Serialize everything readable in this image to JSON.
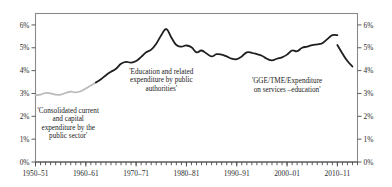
{
  "chart_data": {
    "type": "line",
    "title": "",
    "subtitle": "",
    "xlabel": "",
    "ylabel": "",
    "grid": false,
    "legend_position": "none",
    "xlim": [
      1950,
      2014
    ],
    "ylim": [
      0,
      6.5
    ],
    "y_axis_left": {
      "tick_labels": [
        "0%",
        "1%",
        "2%",
        "3%",
        "4%",
        "5%",
        "6%"
      ],
      "tick_values": [
        0,
        1,
        2,
        3,
        4,
        5,
        6
      ]
    },
    "y_axis_right": {
      "tick_labels": [
        "0%",
        "1%",
        "2%",
        "3%",
        "4%",
        "5%",
        "6%"
      ],
      "tick_values": [
        0,
        1,
        2,
        3,
        4,
        5,
        6
      ]
    },
    "x_axis": {
      "tick_labels": [
        "1950–51",
        "1960–61",
        "1970–71",
        "1980–81",
        "1990–91",
        "2000–01",
        "2010–11"
      ],
      "tick_values": [
        1950,
        1960,
        1970,
        1980,
        1990,
        2000,
        2010
      ],
      "minor_tick_interval": 1
    },
    "annotations": [
      {
        "name": "consolidated-expenditure-label",
        "lines": [
          "'Consolidated current",
          "and capital",
          "expenditure by the",
          "public sector'"
        ],
        "x": 1956.5,
        "y": 2.15
      },
      {
        "name": "education-related-expenditure-label",
        "lines": [
          "'Education and related",
          "expenditure by public",
          "authorities'"
        ],
        "x": 1975.0,
        "y": 3.85
      },
      {
        "name": "gge-tme-expenditure-label",
        "lines": [
          "'GGE/TME/Expenditure",
          "on services –education'"
        ],
        "x": 2000.0,
        "y": 3.45
      }
    ],
    "series": [
      {
        "name": "Consolidated current and capital expenditure by the public sector",
        "color": "#b9b9b9",
        "x": [
          1950,
          1951,
          1952,
          1953,
          1954,
          1955,
          1956,
          1957,
          1958,
          1959,
          1960,
          1961,
          1962
        ],
        "values": [
          2.92,
          2.95,
          3.02,
          3.0,
          2.95,
          2.95,
          3.02,
          3.08,
          3.05,
          3.1,
          3.22,
          3.35,
          3.48
        ]
      },
      {
        "name": "Education and related expenditure by public authorities",
        "color": "#1f1f1f",
        "x": [
          1962,
          1963,
          1964,
          1965,
          1966,
          1967,
          1968,
          1969,
          1970,
          1971,
          1972,
          1973,
          1974,
          1975,
          1976,
          1977,
          1978,
          1979,
          1980,
          1981,
          1982,
          1983,
          1984,
          1985,
          1986,
          1987,
          1988,
          1989,
          1990,
          1991,
          1992,
          1993,
          1994,
          1995,
          1996,
          1997,
          1998,
          1999,
          2000,
          2001,
          2002,
          2003,
          2004,
          2005,
          2006,
          2007,
          2008,
          2009,
          2010
        ],
        "values": [
          3.48,
          3.62,
          3.8,
          3.95,
          4.08,
          4.3,
          4.38,
          4.35,
          4.42,
          4.6,
          4.8,
          4.92,
          5.18,
          5.55,
          5.82,
          5.45,
          5.12,
          5.05,
          5.1,
          5.02,
          4.8,
          4.88,
          4.75,
          4.62,
          4.72,
          4.7,
          4.62,
          4.52,
          4.5,
          4.62,
          4.8,
          4.78,
          4.72,
          4.65,
          4.52,
          4.45,
          4.52,
          4.58,
          4.7,
          4.88,
          4.85,
          5.0,
          5.05,
          5.12,
          5.15,
          5.2,
          5.38,
          5.55,
          5.55
        ]
      },
      {
        "name": "GGE/TME/Expenditure on services –education",
        "color": "#1f1f1f",
        "x": [
          2010,
          2011,
          2012,
          2013
        ],
        "values": [
          5.12,
          4.75,
          4.42,
          4.18
        ]
      }
    ]
  }
}
